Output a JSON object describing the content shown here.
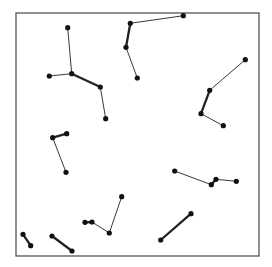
{
  "diagram": {
    "type": "graph",
    "frame": {
      "x": 16,
      "y": 13,
      "width": 243,
      "height": 243,
      "stroke": "#555555",
      "stroke_width": 1.3
    },
    "node_radius": 2.6,
    "node_color": "#111111",
    "thin_edge_width": 0.9,
    "thick_edge_width": 2.3,
    "edge_color": "#222222",
    "clusters": [
      {
        "name": "cluster-top-left",
        "nodes": [
          [
            67.7,
            27.7
          ],
          [
            71.7,
            73.7
          ],
          [
            49.3,
            76
          ],
          [
            100.3,
            87
          ],
          [
            105.7,
            118.7
          ]
        ],
        "edges": [
          [
            0,
            1,
            "thin"
          ],
          [
            2,
            1,
            "thin"
          ],
          [
            1,
            3,
            "thick"
          ],
          [
            3,
            4,
            "thin"
          ]
        ]
      },
      {
        "name": "cluster-top-center",
        "nodes": [
          [
            183.3,
            15.7
          ],
          [
            130.3,
            23.3
          ],
          [
            126,
            47.3
          ],
          [
            137.3,
            78
          ]
        ],
        "edges": [
          [
            0,
            1,
            "thin"
          ],
          [
            1,
            2,
            "thick"
          ],
          [
            2,
            3,
            "thin"
          ]
        ]
      },
      {
        "name": "cluster-right",
        "nodes": [
          [
            245.3,
            59.7
          ],
          [
            209.7,
            90.3
          ],
          [
            201,
            113.7
          ],
          [
            223.3,
            125.7
          ]
        ],
        "edges": [
          [
            0,
            1,
            "thin"
          ],
          [
            1,
            2,
            "thick"
          ],
          [
            2,
            3,
            "thin"
          ]
        ]
      },
      {
        "name": "cluster-mid-left",
        "nodes": [
          [
            52.7,
            137.7
          ],
          [
            66.7,
            133.7
          ],
          [
            66,
            172.3
          ]
        ],
        "edges": [
          [
            0,
            1,
            "thick"
          ],
          [
            0,
            2,
            "thin"
          ]
        ]
      },
      {
        "name": "cluster-mid-right",
        "nodes": [
          [
            174.7,
            171
          ],
          [
            211.3,
            184.7
          ],
          [
            216,
            179.3
          ],
          [
            236.3,
            181.3
          ]
        ],
        "edges": [
          [
            0,
            1,
            "thin"
          ],
          [
            1,
            2,
            "thick"
          ],
          [
            2,
            3,
            "thin"
          ]
        ]
      },
      {
        "name": "cluster-bottom-center",
        "nodes": [
          [
            85,
            222.3
          ],
          [
            92,
            222
          ],
          [
            109.3,
            233
          ],
          [
            121.7,
            196.7
          ]
        ],
        "edges": [
          [
            0,
            1,
            "thick"
          ],
          [
            1,
            2,
            "thin"
          ],
          [
            2,
            3,
            "thin"
          ]
        ]
      },
      {
        "name": "cluster-bottom-left-a",
        "nodes": [
          [
            23,
            234.3
          ],
          [
            30.7,
            245.7
          ]
        ],
        "edges": [
          [
            0,
            1,
            "thick"
          ]
        ]
      },
      {
        "name": "cluster-bottom-left-b",
        "nodes": [
          [
            52,
            236
          ],
          [
            72,
            251
          ]
        ],
        "edges": [
          [
            0,
            1,
            "thick"
          ]
        ]
      },
      {
        "name": "cluster-bottom-right",
        "nodes": [
          [
            191,
            213.7
          ],
          [
            160.7,
            240
          ]
        ],
        "edges": [
          [
            0,
            1,
            "thick"
          ]
        ]
      }
    ]
  }
}
